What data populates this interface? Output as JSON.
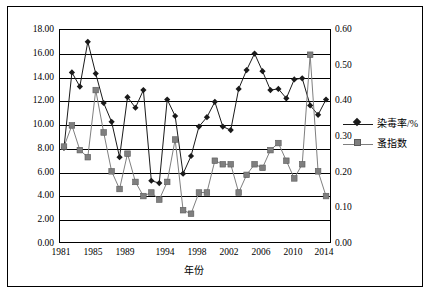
{
  "chart_data": {
    "type": "line",
    "title": "",
    "xlabel": "年份",
    "ylabel": "",
    "y2label": "",
    "grid": true,
    "legend_position": "right",
    "x": [
      1981,
      1982,
      1983,
      1984,
      1985,
      1986,
      1987,
      1988,
      1989,
      1990,
      1991,
      1992,
      1993,
      1994,
      1995,
      1996,
      1997,
      1998,
      1999,
      2000,
      2001,
      2002,
      2003,
      2004,
      2005,
      2006,
      2007,
      2008,
      2009,
      2010,
      2011,
      2012,
      2013,
      2014
    ],
    "xticks": [
      "1981",
      "1985",
      "1989",
      "1994",
      "1998",
      "2002",
      "2006",
      "2010",
      "2014"
    ],
    "yticks_left": [
      "0.00",
      "2.00",
      "4.00",
      "6.00",
      "8.00",
      "10.00",
      "12.00",
      "14.00",
      "16.00",
      "18.00"
    ],
    "yticks_right": [
      "0.00",
      "0.10",
      "0.20",
      "0.30",
      "0.40",
      "0.50",
      "0.60"
    ],
    "ylim_left": [
      0,
      18
    ],
    "ylim_right": [
      0,
      0.6
    ],
    "series": [
      {
        "name": "染毒率/%",
        "axis": "left",
        "marker": "diamond",
        "color": "#1a1a1a",
        "values": [
          8.0,
          14.4,
          13.2,
          17.0,
          14.3,
          11.8,
          10.2,
          7.2,
          12.3,
          11.4,
          12.9,
          5.2,
          5.0,
          12.1,
          10.7,
          5.8,
          7.3,
          9.8,
          10.6,
          11.9,
          9.8,
          9.5,
          13.0,
          14.6,
          16.0,
          14.5,
          12.9,
          13.0,
          12.2,
          13.8,
          13.9,
          11.6,
          10.8,
          12.1
        ]
      },
      {
        "name": "蚤指数",
        "axis": "right",
        "marker": "square",
        "color": "#7f7f7f",
        "values": [
          0.27,
          0.33,
          0.26,
          0.24,
          0.43,
          0.31,
          0.2,
          0.15,
          0.25,
          0.17,
          0.13,
          0.14,
          0.12,
          0.17,
          0.29,
          0.09,
          0.08,
          0.14,
          0.14,
          0.23,
          0.22,
          0.22,
          0.14,
          0.19,
          0.22,
          0.21,
          0.26,
          0.28,
          0.23,
          0.18,
          0.22,
          0.53,
          0.2,
          0.13
        ]
      }
    ]
  }
}
